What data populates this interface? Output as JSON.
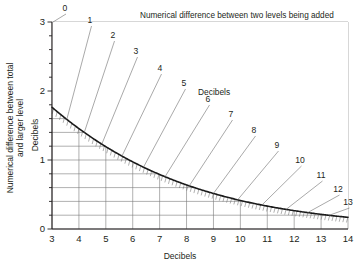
{
  "chart": {
    "title": "Numerical difference between two levels being added",
    "inner_label": "Decibels",
    "x_axis": {
      "label": "Decibels",
      "ticks": [
        "3",
        "4",
        "5",
        "6",
        "7",
        "8",
        "9",
        "10",
        "11",
        "12",
        "13",
        "14"
      ],
      "min": 3,
      "max": 14
    },
    "y_axis": {
      "label_line1": "Numerical difference between total",
      "label_line2": "and larger level",
      "label_inner": "Decibels",
      "ticks": [
        "0",
        "1",
        "2",
        "3"
      ],
      "min": 0,
      "max": 3
    },
    "callouts": [
      "0",
      "1",
      "2",
      "3",
      "4",
      "5",
      "6",
      "7",
      "8",
      "9",
      "10",
      "11",
      "12",
      "13"
    ],
    "colors": {
      "curve": "#1a1a1a",
      "grid": "#7a7a7a",
      "axis": "#231f20",
      "hatch": "#6e6e6e",
      "background": "#ffffff"
    }
  },
  "chart_data": {
    "type": "line",
    "title": "Numerical difference between two levels being added",
    "xlabel": "Decibels",
    "ylabel": "Numerical difference between total and larger level (Decibels)",
    "xlim": [
      3,
      14
    ],
    "ylim": [
      0,
      3
    ],
    "grid": true,
    "legend": "none",
    "x_ticks": [
      3,
      4,
      5,
      6,
      7,
      8,
      9,
      10,
      11,
      12,
      13,
      14
    ],
    "y_ticks": [
      0,
      1,
      2,
      3
    ],
    "y_minor_tick_step": 0.2,
    "series": [
      {
        "name": "Decibel addition curve",
        "x": [
          3,
          3.5,
          4,
          4.5,
          5,
          5.5,
          6,
          6.5,
          7,
          7.5,
          8,
          8.5,
          9,
          9.5,
          10,
          10.5,
          11,
          11.5,
          12,
          12.5,
          13,
          13.5,
          14
        ],
        "y": [
          3.02,
          2.73,
          2.45,
          2.2,
          1.97,
          1.76,
          1.57,
          1.4,
          1.24,
          1.1,
          0.97,
          0.86,
          0.76,
          0.67,
          0.59,
          0.52,
          0.46,
          0.41,
          0.36,
          0.31,
          0.28,
          0.24,
          0.21
        ]
      }
    ],
    "annotations": [
      {
        "label": "0",
        "x": 3,
        "y": 3.02
      },
      {
        "label": "1",
        "x": 3.55,
        "y": 2.7
      },
      {
        "label": "2",
        "x": 4.2,
        "y": 2.35
      },
      {
        "label": "3",
        "x": 4.85,
        "y": 2.05
      },
      {
        "label": "4",
        "x": 5.6,
        "y": 1.75
      },
      {
        "label": "5",
        "x": 6.4,
        "y": 1.45
      },
      {
        "label": "6",
        "x": 7.2,
        "y": 1.2
      },
      {
        "label": "7",
        "x": 8.1,
        "y": 1.0
      },
      {
        "label": "8",
        "x": 9.0,
        "y": 0.82
      },
      {
        "label": "9",
        "x": 9.9,
        "y": 0.66
      },
      {
        "label": "10",
        "x": 10.8,
        "y": 0.53
      },
      {
        "label": "11",
        "x": 11.7,
        "y": 0.43
      },
      {
        "label": "12",
        "x": 12.5,
        "y": 0.34
      },
      {
        "label": "13",
        "x": 13.3,
        "y": 0.27
      }
    ]
  }
}
